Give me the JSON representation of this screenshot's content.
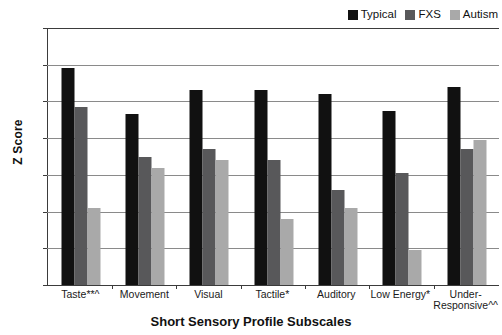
{
  "chart_data": {
    "type": "bar",
    "title": "",
    "xlabel": "Short Sensory Profile Subscales",
    "ylabel": "Z Score",
    "categories": [
      "Taste**^",
      "Movement",
      "Visual",
      "Tactile*",
      "Auditory",
      "Low Energy*",
      "Under-Responsive^^"
    ],
    "series": [
      {
        "name": "Typical",
        "color": "#111111",
        "values": [
          0.9,
          -0.35,
          0.3,
          0.3,
          0.2,
          -0.25,
          0.4
        ]
      },
      {
        "name": "FXS",
        "color": "#58585a",
        "values": [
          -0.15,
          -1.5,
          -1.3,
          -1.6,
          -2.4,
          -1.95,
          -1.3
        ]
      },
      {
        "name": "Autism",
        "color": "#a9a9a9",
        "values": [
          -2.9,
          -1.8,
          -1.6,
          -3.2,
          -2.9,
          -4.05,
          -1.05
        ]
      }
    ],
    "ylim": [
      -5,
      2
    ],
    "yticks": [
      2,
      1,
      0,
      -1,
      -2,
      -3,
      -4,
      -5
    ],
    "ytick_labels": [
      "2",
      "1",
      "0",
      "-1",
      "-2",
      "-3",
      "-4",
      "-5"
    ],
    "grid": true,
    "legend_position": "top-right",
    "baseline": -5
  },
  "legend": {
    "items": [
      {
        "label": "Typical",
        "color": "#111111"
      },
      {
        "label": "FXS",
        "color": "#58585a"
      },
      {
        "label": "Autism",
        "color": "#a9a9a9"
      }
    ]
  }
}
